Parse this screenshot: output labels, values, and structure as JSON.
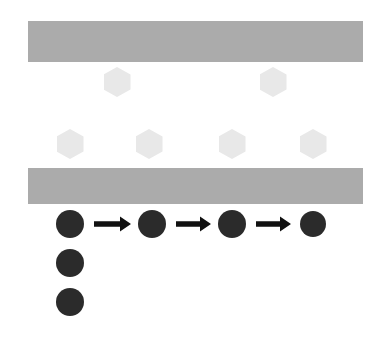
{
  "figure": {
    "title": "",
    "background_color": "#ffffff",
    "width": 384,
    "height": 344
  },
  "colors": {
    "layer_bar": "#ababab",
    "hexagon": "#e8e8e8",
    "particle": "#2b2b2b",
    "arrow": "#111111",
    "background": "#ffffff"
  },
  "layer_bars": [
    {
      "name": "top-layer-bar",
      "x": 28,
      "y": 21,
      "width": 335,
      "height": 41
    },
    {
      "name": "bottom-layer-bar",
      "x": 28,
      "y": 168,
      "width": 335,
      "height": 36
    }
  ],
  "hexagons": {
    "upper_row": [
      {
        "cx": 117,
        "cy": 82,
        "w": 27,
        "h": 30
      },
      {
        "cx": 273,
        "cy": 82,
        "w": 27,
        "h": 30
      }
    ],
    "lower_row": [
      {
        "cx": 70,
        "cy": 144,
        "w": 27,
        "h": 30
      },
      {
        "cx": 149,
        "cy": 144,
        "w": 27,
        "h": 30
      },
      {
        "cx": 232,
        "cy": 144,
        "w": 27,
        "h": 30
      },
      {
        "cx": 313,
        "cy": 144,
        "w": 27,
        "h": 30
      }
    ]
  },
  "particles": {
    "chain_row": [
      {
        "cx": 70,
        "cy": 224,
        "r": 14
      },
      {
        "cx": 152,
        "cy": 224,
        "r": 14
      },
      {
        "cx": 232,
        "cy": 224,
        "r": 14
      },
      {
        "cx": 313,
        "cy": 224,
        "r": 13
      }
    ],
    "stack_column": [
      {
        "cx": 70,
        "cy": 263,
        "r": 14
      },
      {
        "cx": 70,
        "cy": 302,
        "r": 14
      }
    ]
  },
  "arrows": [
    {
      "x1": 94,
      "y": 224,
      "x2": 131
    },
    {
      "x1": 176,
      "y": 224,
      "x2": 211
    },
    {
      "x1": 256,
      "y": 224,
      "x2": 291
    }
  ]
}
